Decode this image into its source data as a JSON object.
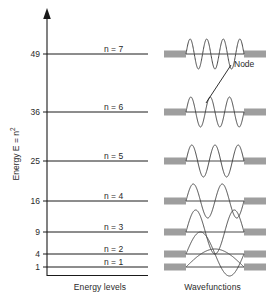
{
  "figure": {
    "y_axis_label": "Energy E = n",
    "y_axis_label_exp": "2",
    "caption_left": "Energy levels",
    "caption_right": "Wavefunctions",
    "node_annotation": "Node"
  },
  "chart_data": {
    "type": "line",
    "title": "",
    "xlabel": "",
    "ylabel": "Energy E = n^2",
    "ylim": [
      0,
      56
    ],
    "grid": false,
    "legend": "none",
    "categories": [
      "n = 1",
      "n = 2",
      "n = 3",
      "n = 4",
      "n = 5",
      "n = 6",
      "n = 7"
    ],
    "tick_labels": [
      "1",
      "4",
      "9",
      "16",
      "25",
      "36",
      "49"
    ],
    "values": [
      1,
      4,
      9,
      16,
      25,
      36,
      49
    ],
    "series": [
      {
        "name": "Energy levels",
        "values": [
          1,
          4,
          9,
          16,
          25,
          36,
          49
        ]
      }
    ],
    "levels": [
      {
        "n": 7,
        "energy": 49,
        "tick": "49",
        "label": "n = 7",
        "y": 54,
        "half_waves": 7
      },
      {
        "n": 6,
        "energy": 36,
        "tick": "36",
        "label": "n = 6",
        "y": 112,
        "half_waves": 6
      },
      {
        "n": 5,
        "energy": 25,
        "tick": "25",
        "label": "n = 5",
        "y": 161,
        "half_waves": 5
      },
      {
        "n": 4,
        "energy": 16,
        "tick": "16",
        "label": "n = 4",
        "y": 201,
        "half_waves": 4
      },
      {
        "n": 3,
        "energy": 9,
        "tick": "9",
        "label": "n = 3",
        "y": 232,
        "half_waves": 3
      },
      {
        "n": 2,
        "energy": 4,
        "tick": "4",
        "label": "n = 2",
        "y": 254,
        "half_waves": 2
      },
      {
        "n": 1,
        "energy": 1,
        "tick": "1",
        "label": "n = 1",
        "y": 267,
        "half_waves": 1
      }
    ]
  },
  "colors": {
    "line": "#1a1a1a",
    "wave": "#4a4a4a",
    "well_wall": "#9e9e9e",
    "text": "#2a2a2a"
  }
}
